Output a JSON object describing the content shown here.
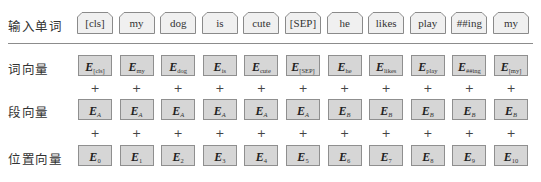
{
  "row_labels": {
    "input_tokens": "输入单词",
    "token_embeddings": "词向量",
    "segment_embeddings": "段向量",
    "position_embeddings": "位置向量"
  },
  "operator": "+",
  "embedding_symbol": "E",
  "columns": [
    {
      "token": "[cls]",
      "token_sub": "[cls]",
      "segment_sub": "A",
      "position_sub": "0"
    },
    {
      "token": "my",
      "token_sub": "my",
      "segment_sub": "A",
      "position_sub": "1"
    },
    {
      "token": "dog",
      "token_sub": "dog",
      "segment_sub": "A",
      "position_sub": "2"
    },
    {
      "token": "is",
      "token_sub": "is",
      "segment_sub": "A",
      "position_sub": "3"
    },
    {
      "token": "cute",
      "token_sub": "cute",
      "segment_sub": "A",
      "position_sub": "4"
    },
    {
      "token": "[SEP]",
      "token_sub": "[SEP]",
      "segment_sub": "A",
      "position_sub": "5"
    },
    {
      "token": "he",
      "token_sub": "he",
      "segment_sub": "B",
      "position_sub": "6"
    },
    {
      "token": "likes",
      "token_sub": "likes",
      "segment_sub": "B",
      "position_sub": "7"
    },
    {
      "token": "play",
      "token_sub": "play",
      "segment_sub": "B",
      "position_sub": "8"
    },
    {
      "token": "##ing",
      "token_sub": "##ing",
      "segment_sub": "B",
      "position_sub": "9"
    },
    {
      "token": "my",
      "token_sub": "[my]",
      "segment_sub": "B",
      "position_sub": "10"
    }
  ],
  "colors": {
    "token_fill": "#f0f0f0",
    "token_border": "#8a8a8a",
    "embedding_fill": "#d6d6d6",
    "embedding_border": "#8f8f8f",
    "divider": "#8c8c8c"
  }
}
